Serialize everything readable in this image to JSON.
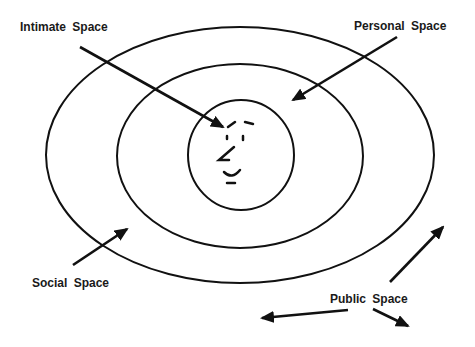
{
  "diagram": {
    "type": "proxemics-zones",
    "labels": {
      "intimate": "Intimate Space",
      "personal": "Personal Space",
      "social": "Social Space",
      "public": "Public Space"
    },
    "zones": [
      {
        "name": "intimate",
        "shape": "circle",
        "cx": 241,
        "cy": 155,
        "rx": 53,
        "ry": 55
      },
      {
        "name": "personal",
        "shape": "ellipse",
        "cx": 240,
        "cy": 156,
        "rx": 123,
        "ry": 92
      },
      {
        "name": "social",
        "shape": "ellipse",
        "cx": 240,
        "cy": 155,
        "rx": 194,
        "ry": 128
      }
    ],
    "center_figure": "face-sketch",
    "colors": {
      "stroke": "#111111",
      "background": "#ffffff"
    }
  }
}
